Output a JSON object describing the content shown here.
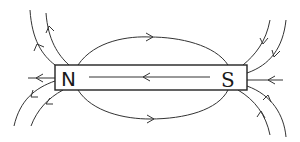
{
  "diagram": {
    "magnet": {
      "north_label": "N",
      "south_label": "S",
      "internal_field_direction": "S to N"
    },
    "field_lines": {
      "external_direction": "N to S",
      "count_top_loop": 1,
      "count_bottom_loop": 1,
      "count_left_outer": 4,
      "count_right_outer": 4,
      "axial_left": 1,
      "axial_right": 1
    },
    "colors": {
      "stroke": "#333333",
      "background": "#ffffff"
    }
  }
}
